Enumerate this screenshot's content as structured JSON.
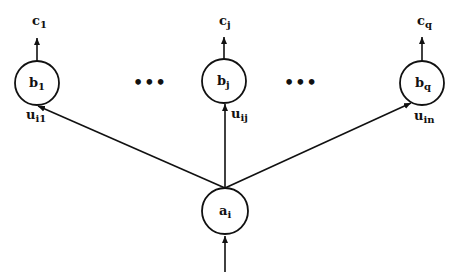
{
  "diagram": {
    "nodes": {
      "a": {
        "base": "a",
        "sub": "i"
      },
      "b1": {
        "base": "b",
        "sub": "1"
      },
      "bj": {
        "base": "b",
        "sub": "j"
      },
      "bq": {
        "base": "b",
        "sub": "q"
      }
    },
    "outputs": {
      "c1": {
        "base": "c",
        "sub": "1"
      },
      "cj": {
        "base": "c",
        "sub": "j"
      },
      "cq": {
        "base": "c",
        "sub": "q"
      }
    },
    "weights": {
      "u1": {
        "base": "u",
        "sub": "i1"
      },
      "uj": {
        "base": "u",
        "sub": "ij"
      },
      "un": {
        "base": "u",
        "sub": "in"
      }
    },
    "ellipsis": "•••",
    "colors": {
      "stroke": "#111111",
      "background": "#ffffff"
    }
  }
}
